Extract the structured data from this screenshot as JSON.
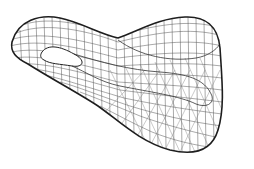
{
  "figure": {
    "background": "#ffffff",
    "line_color": "#3a3a3a",
    "outline_color": "#1e1e1e"
  }
}
